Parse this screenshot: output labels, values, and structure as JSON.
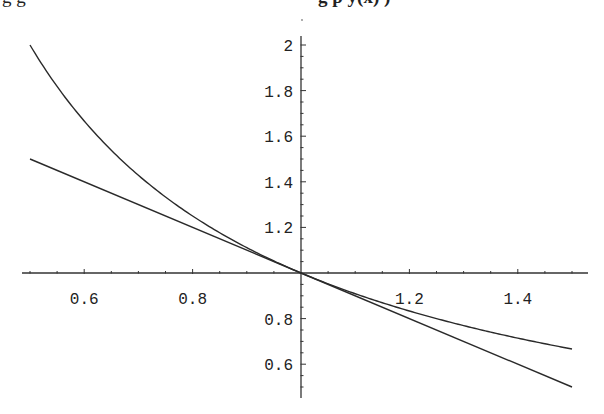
{
  "caption_fragment": {
    "left_text": "g                 g",
    "right_text": "g p   y(x)   )"
  },
  "chart_data": {
    "type": "line",
    "title": "",
    "xlabel": "",
    "ylabel": "",
    "xlim": [
      0.5,
      1.5
    ],
    "ylim": [
      0.5,
      2.0
    ],
    "axes_origin": [
      1.0,
      1.0
    ],
    "grid": false,
    "legend": null,
    "x_ticks_major": [
      0.6,
      0.8,
      1.2,
      1.4
    ],
    "x_tick_labels": [
      "0.6",
      "0.8",
      "1.2",
      "1.4"
    ],
    "y_ticks_major": [
      0.6,
      0.8,
      1.2,
      1.4,
      1.6,
      1.8,
      2.0
    ],
    "y_tick_labels": [
      "0.6",
      "0.8",
      "1.2",
      "1.4",
      "1.6",
      "1.8",
      "2"
    ],
    "minor_tick_step": 0.05,
    "series": [
      {
        "name": "y = 1/x",
        "x": [
          0.5,
          0.6,
          0.7,
          0.8,
          0.9,
          1.0,
          1.1,
          1.2,
          1.3,
          1.4,
          1.5
        ],
        "values": [
          2.0,
          1.667,
          1.429,
          1.25,
          1.111,
          1.0,
          0.909,
          0.833,
          0.769,
          0.714,
          0.667
        ]
      },
      {
        "name": "y = 2 - x (tangent at x=1)",
        "x": [
          0.5,
          1.0,
          1.5
        ],
        "values": [
          1.5,
          1.0,
          0.5
        ]
      }
    ]
  },
  "layout": {
    "x_axis_px": [
      22,
      588
    ],
    "y_axis_px": [
      36,
      398
    ],
    "x_to_px": {
      "x0": 1.0,
      "px0": 301,
      "scale": 542
    },
    "y_to_px": {
      "y0": 1.0,
      "px0": 273,
      "scale": 228
    }
  }
}
